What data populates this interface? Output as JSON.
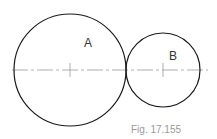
{
  "figure": {
    "caption": "Fig. 17.155",
    "circles": [
      {
        "id": "A",
        "label": "A",
        "cx": 70,
        "cy": 70,
        "r": 56,
        "label_x": 88,
        "label_y": 46
      },
      {
        "id": "B",
        "label": "B",
        "cx": 163,
        "cy": 70,
        "r": 37,
        "label_x": 173,
        "label_y": 59
      }
    ],
    "centerline": {
      "y": 70,
      "x1": 12,
      "x2": 208
    },
    "colors": {
      "circle_stroke": "#1a1a1a",
      "centerline": "#9a9a9a",
      "label": "#333333",
      "caption": "#9a9a9a"
    }
  }
}
